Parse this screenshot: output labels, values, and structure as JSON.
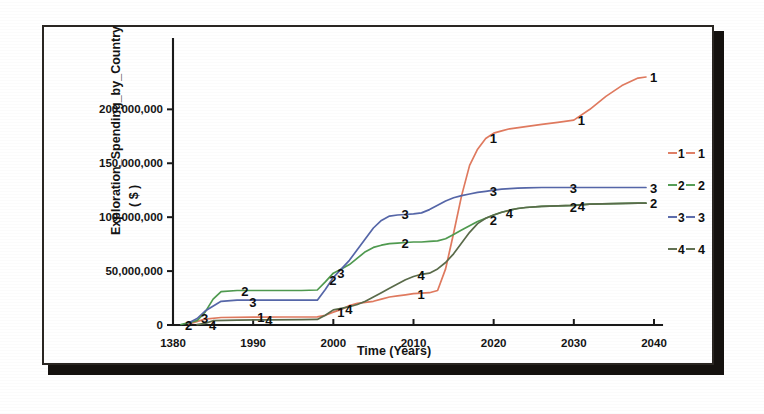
{
  "chart_data": {
    "type": "line",
    "title": "",
    "xlabel": "Time (Years)",
    "ylabel": "Exploration_Spending_by_Country ( $ )",
    "ylabel_line1": "Exploration_Spending_by_Country",
    "ylabel_line2": "( $ )",
    "xlim": [
      1980,
      2040
    ],
    "ylim": [
      0,
      230000000
    ],
    "xticks": [
      1980,
      1990,
      2000,
      2010,
      2020,
      2030,
      2040
    ],
    "xtick_labels": [
      "1380",
      "1990",
      "2000",
      "2010",
      "2020",
      "2030",
      "2040"
    ],
    "yticks": [
      0,
      50000000,
      100000000,
      150000000,
      200000000
    ],
    "ytick_labels": [
      "0",
      "50,000,000",
      "100,000,000",
      "150,000,000",
      "200,000,000"
    ],
    "grid": false,
    "legend_position": "right",
    "legend_title": "",
    "series": [
      {
        "name": "1",
        "label": "1",
        "color": "#e07a5f",
        "x": [
          1982,
          1984,
          1986,
          1990,
          1994,
          1998,
          1999,
          2000,
          2001,
          2002,
          2003,
          2004,
          2005,
          2006,
          2007,
          2008,
          2009,
          2010,
          2011,
          2012,
          2013,
          2014,
          2015,
          2016,
          2017,
          2018,
          2019,
          2020,
          2021,
          2022,
          2024,
          2026,
          2028,
          2030,
          2032,
          2034,
          2036,
          2038,
          2039
        ],
        "y": [
          1000000,
          5500000,
          7000000,
          7200000,
          7400000,
          7600000,
          9000000,
          12000000,
          14500000,
          18000000,
          20000000,
          21000000,
          22000000,
          24000000,
          26000000,
          27000000,
          28000000,
          29000000,
          29500000,
          30000000,
          32000000,
          52000000,
          85000000,
          120000000,
          148000000,
          163000000,
          173000000,
          178000000,
          180000000,
          182000000,
          184000000,
          186000000,
          188000000,
          190000000,
          200000000,
          212000000,
          222000000,
          229000000,
          230000000
        ],
        "annotations": [
          {
            "x": 1990,
            "y": 7200000,
            "text": "1"
          },
          {
            "x": 2000,
            "y": 12000000,
            "text": "1"
          },
          {
            "x": 2010,
            "y": 29000000,
            "text": "1"
          },
          {
            "x": 2019,
            "y": 173000000,
            "text": "1"
          },
          {
            "x": 2030,
            "y": 190000000,
            "text": "1"
          },
          {
            "x": 2039,
            "y": 230000000,
            "text": "1"
          }
        ]
      },
      {
        "name": "2",
        "label": "2",
        "color": "#4f9a4f",
        "x": [
          1981,
          1983,
          1984,
          1985,
          1986,
          1988,
          1992,
          1996,
          1998,
          1999,
          2000,
          2001,
          2002,
          2003,
          2004,
          2005,
          2006,
          2007,
          2008,
          2009,
          2010,
          2011,
          2012,
          2013,
          2014,
          2015,
          2016,
          2017,
          2018,
          2019,
          2020,
          2021,
          2022,
          2023,
          2024,
          2026,
          2028,
          2030,
          2032,
          2035,
          2038,
          2039
        ],
        "y": [
          500000,
          4000000,
          12000000,
          24000000,
          31000000,
          32000000,
          32000000,
          32000000,
          32500000,
          40000000,
          48000000,
          52000000,
          56000000,
          62000000,
          68000000,
          72000000,
          74000000,
          75500000,
          76000000,
          76500000,
          77000000,
          77000000,
          77500000,
          78000000,
          80000000,
          84000000,
          88000000,
          92000000,
          96000000,
          99000000,
          102000000,
          104500000,
          106500000,
          108000000,
          109000000,
          110000000,
          110500000,
          111000000,
          112000000,
          112500000,
          113000000,
          113000000
        ],
        "annotations": [
          {
            "x": 1988,
            "y": 31500000,
            "text": "2"
          },
          {
            "x": 1999,
            "y": 42000000,
            "text": "2"
          },
          {
            "x": 2008,
            "y": 76000000,
            "text": "2"
          },
          {
            "x": 2019,
            "y": 97000000,
            "text": "2"
          },
          {
            "x": 2029,
            "y": 109500000,
            "text": "2"
          },
          {
            "x": 2039,
            "y": 113000000,
            "text": "2"
          },
          {
            "x": 1981,
            "y": 0,
            "text": "2"
          }
        ]
      },
      {
        "name": "3",
        "label": "3",
        "color": "#5566a8",
        "x": [
          1982,
          1983,
          1984,
          1986,
          1988,
          1992,
          1996,
          1998,
          1999,
          2000,
          2001,
          2002,
          2003,
          2004,
          2005,
          2006,
          2007,
          2008,
          2009,
          2010,
          2011,
          2012,
          2013,
          2014,
          2015,
          2016,
          2017,
          2018,
          2019,
          2020,
          2021,
          2022,
          2023,
          2024,
          2026,
          2030,
          2034,
          2038,
          2039
        ],
        "y": [
          2000000,
          6000000,
          13000000,
          22000000,
          23000000,
          23000000,
          23000000,
          23000000,
          33000000,
          44000000,
          52000000,
          60000000,
          70000000,
          80000000,
          90000000,
          97000000,
          101000000,
          102000000,
          102500000,
          103000000,
          104000000,
          107000000,
          111000000,
          115000000,
          118000000,
          120000000,
          121500000,
          123000000,
          124000000,
          125000000,
          126000000,
          126500000,
          127000000,
          127200000,
          127500000,
          127500000,
          127500000,
          127500000,
          127500000
        ],
        "annotations": [
          {
            "x": 1983,
            "y": 6500000,
            "text": "3"
          },
          {
            "x": 1989,
            "y": 21500000,
            "text": "3"
          },
          {
            "x": 2000,
            "y": 48000000,
            "text": "3"
          },
          {
            "x": 2008,
            "y": 102500000,
            "text": "3"
          },
          {
            "x": 2019,
            "y": 124500000,
            "text": "3"
          },
          {
            "x": 2029,
            "y": 127500000,
            "text": "3"
          },
          {
            "x": 2039,
            "y": 127500000,
            "text": "3"
          }
        ]
      },
      {
        "name": "4",
        "label": "4",
        "color": "#5a6b4a",
        "x": [
          1983,
          1984,
          1985,
          1988,
          1992,
          1996,
          1998,
          1999,
          2000,
          2001,
          2002,
          2003,
          2004,
          2005,
          2006,
          2007,
          2008,
          2009,
          2010,
          2011,
          2012,
          2013,
          2014,
          2015,
          2016,
          2017,
          2018,
          2019,
          2020,
          2021,
          2022,
          2023,
          2024,
          2026,
          2028,
          2030,
          2032,
          2035,
          2038,
          2039
        ],
        "y": [
          300000,
          1500000,
          4000000,
          4500000,
          4800000,
          5000000,
          5200000,
          9000000,
          14000000,
          15500000,
          17000000,
          19000000,
          22000000,
          26000000,
          30000000,
          34000000,
          38000000,
          42000000,
          45000000,
          47000000,
          48000000,
          52000000,
          58000000,
          66000000,
          76000000,
          86000000,
          94000000,
          99000000,
          102000000,
          104500000,
          106500000,
          108000000,
          109000000,
          110000000,
          110500000,
          111000000,
          112000000,
          112500000,
          113000000,
          113000000
        ],
        "annotations": [
          {
            "x": 1984,
            "y": 0,
            "text": "4"
          },
          {
            "x": 1991,
            "y": 4500000,
            "text": "4"
          },
          {
            "x": 2001,
            "y": 15000000,
            "text": "4"
          },
          {
            "x": 2010,
            "y": 46000000,
            "text": "4"
          },
          {
            "x": 2021,
            "y": 103500000,
            "text": "4"
          },
          {
            "x": 2030,
            "y": 110500000,
            "text": "4"
          }
        ]
      }
    ],
    "legend_entries": [
      {
        "key": "1",
        "label": "1",
        "color": "#e07a5f"
      },
      {
        "key": "2",
        "label": "2",
        "color": "#4f9a4f"
      },
      {
        "key": "3",
        "label": "3",
        "color": "#5566a8"
      },
      {
        "key": "4",
        "label": "4",
        "color": "#5a6b4a"
      }
    ]
  }
}
